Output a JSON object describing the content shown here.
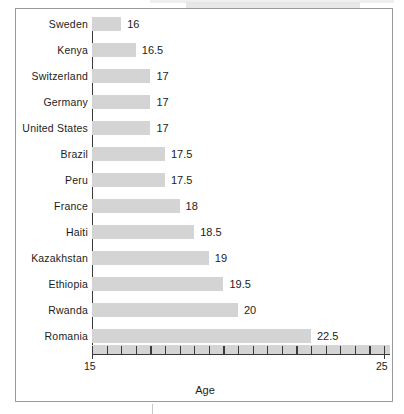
{
  "chart_data": {
    "type": "bar",
    "orientation": "horizontal",
    "title": "",
    "xlabel": "Age",
    "ylabel": "",
    "xlim": [
      15,
      25
    ],
    "xticks": [
      15,
      25
    ],
    "xtick_labels": [
      "15",
      "25"
    ],
    "minor_tick_step": 0.5,
    "grid": false,
    "legend": null,
    "bar_color": "#d4d4d4",
    "axis_color": "#3a3a3a",
    "frame_color": "#9a9a9a",
    "text_color": "#1c1c1c",
    "categories": [
      "Sweden",
      "Kenya",
      "Switzerland",
      "Germany",
      "United States",
      "Brazil",
      "Peru",
      "France",
      "Haiti",
      "Kazakhstan",
      "Ethiopia",
      "Rwanda",
      "Romania"
    ],
    "values": [
      16,
      16.5,
      17,
      17,
      17,
      17.5,
      17.5,
      18,
      18.5,
      19,
      19.5,
      20,
      22.5
    ],
    "value_labels": [
      "16",
      "16.5",
      "17",
      "17",
      "17",
      "17.5",
      "17.5",
      "18",
      "18.5",
      "19",
      "19.5",
      "20",
      "22.5"
    ]
  }
}
